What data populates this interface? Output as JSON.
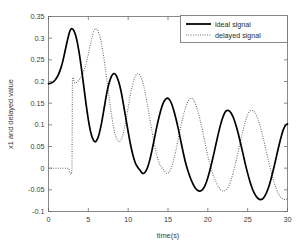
{
  "chart_data": {
    "type": "line",
    "title": "",
    "xlabel": "time(s)",
    "ylabel": "x1 and delayed value",
    "xlim": [
      0,
      30
    ],
    "ylim": [
      -0.1,
      0.35
    ],
    "xticks": [
      "0",
      "5",
      "10",
      "15",
      "20",
      "25",
      "30"
    ],
    "xtick_values": [
      0,
      5,
      10,
      15,
      20,
      25,
      30
    ],
    "yticks": [
      "0.35",
      "0.3",
      "0.25",
      "0.2",
      "0.15",
      "0.1",
      "0.05",
      "0",
      "-0.05",
      "-0.1"
    ],
    "ytick_values": [
      0.35,
      0.3,
      0.25,
      0.2,
      0.15,
      0.1,
      0.05,
      0,
      -0.05,
      -0.1
    ],
    "grid": false,
    "legend_position": "upper right",
    "legend": [
      "ideal signal",
      "delayed signal"
    ],
    "colors": {
      "ideal": "#000000",
      "delayed": "#555555",
      "axis": "#6b6b6b",
      "background": "#ffffff"
    },
    "series": [
      {
        "name": "ideal signal",
        "style": "solid",
        "x": [
          0.0,
          0.3,
          0.6,
          0.9,
          1.2,
          1.5,
          1.8,
          2.1,
          2.4,
          2.7,
          2.9,
          3.2,
          3.5,
          3.8,
          4.1,
          4.4,
          4.7,
          5.0,
          5.3,
          5.6,
          5.9,
          6.2,
          6.4,
          6.7,
          7.0,
          7.3,
          7.6,
          7.9,
          8.2,
          8.5,
          8.8,
          9.1,
          9.4,
          9.7,
          10.0,
          10.3,
          10.6,
          10.9,
          11.2,
          11.5,
          11.8,
          12.1,
          12.4,
          12.7,
          13.0,
          13.3,
          13.6,
          13.9,
          14.2,
          14.5,
          14.8,
          15.1,
          15.4,
          15.7,
          16.0,
          16.3,
          16.6,
          16.9,
          17.2,
          17.5,
          17.8,
          18.1,
          18.4,
          18.7,
          19.0,
          19.3,
          19.6,
          19.9,
          20.2,
          20.5,
          20.8,
          21.1,
          21.4,
          21.7,
          22.0,
          22.3,
          22.6,
          22.9,
          23.2,
          23.5,
          23.8,
          24.1,
          24.4,
          24.7,
          25.0,
          25.3,
          25.6,
          25.9,
          26.2,
          26.5,
          26.8,
          27.1,
          27.4,
          27.7,
          28.0,
          28.3,
          28.6,
          28.9,
          29.2,
          29.5,
          29.8,
          30.0
        ],
        "y": [
          0.195,
          0.196,
          0.199,
          0.205,
          0.214,
          0.228,
          0.247,
          0.272,
          0.297,
          0.317,
          0.322,
          0.317,
          0.3,
          0.272,
          0.235,
          0.193,
          0.15,
          0.112,
          0.083,
          0.066,
          0.061,
          0.07,
          0.082,
          0.108,
          0.14,
          0.172,
          0.196,
          0.212,
          0.218,
          0.214,
          0.2,
          0.178,
          0.148,
          0.116,
          0.084,
          0.054,
          0.03,
          0.012,
          0.002,
          -0.005,
          -0.012,
          -0.01,
          0.0,
          0.018,
          0.042,
          0.069,
          0.096,
          0.12,
          0.14,
          0.154,
          0.161,
          0.16,
          0.151,
          0.135,
          0.114,
          0.09,
          0.063,
          0.037,
          0.013,
          -0.006,
          -0.022,
          -0.035,
          -0.045,
          -0.051,
          -0.053,
          -0.05,
          -0.042,
          -0.028,
          -0.009,
          0.013,
          0.037,
          0.062,
          0.086,
          0.107,
          0.123,
          0.132,
          0.133,
          0.128,
          0.117,
          0.101,
          0.081,
          0.058,
          0.034,
          0.01,
          -0.012,
          -0.032,
          -0.048,
          -0.06,
          -0.068,
          -0.072,
          -0.072,
          -0.066,
          -0.055,
          -0.04,
          -0.02,
          0.002,
          0.026,
          0.05,
          0.072,
          0.09,
          0.1,
          0.102
        ]
      },
      {
        "name": "delayed signal",
        "style": "dotted",
        "delay_seconds": 3,
        "x": [
          0.0,
          0.5,
          1.0,
          1.5,
          2.0,
          2.5,
          2.95,
          3.0,
          3.3,
          3.6,
          3.9,
          4.2,
          4.5,
          4.8,
          5.1,
          5.4,
          5.7,
          5.9,
          6.2,
          6.5,
          6.8,
          7.1,
          7.4,
          7.7,
          8.0,
          8.3,
          8.6,
          8.9,
          9.2,
          9.4,
          9.7,
          10.0,
          10.3,
          10.6,
          10.9,
          11.2,
          11.5,
          11.8,
          12.1,
          12.4,
          12.7,
          13.0,
          13.3,
          13.6,
          13.9,
          14.2,
          14.5,
          14.8,
          15.1,
          15.4,
          15.7,
          16.0,
          16.3,
          16.6,
          16.9,
          17.2,
          17.5,
          17.8,
          18.1,
          18.4,
          18.7,
          19.0,
          19.3,
          19.6,
          19.9,
          20.2,
          20.5,
          20.8,
          21.1,
          21.4,
          21.7,
          22.0,
          22.3,
          22.6,
          22.9,
          23.2,
          23.5,
          23.8,
          24.1,
          24.4,
          24.7,
          25.0,
          25.3,
          25.6,
          25.9,
          26.2,
          26.5,
          26.8,
          27.1,
          27.4,
          27.7,
          28.0,
          28.3,
          28.6,
          28.9,
          29.2,
          29.5,
          29.8,
          30.0
        ],
        "y": [
          0.0,
          0.0,
          0.0,
          0.0,
          0.0,
          0.0,
          0.0,
          0.195,
          0.196,
          0.199,
          0.205,
          0.214,
          0.228,
          0.247,
          0.272,
          0.297,
          0.317,
          0.322,
          0.317,
          0.3,
          0.272,
          0.235,
          0.193,
          0.15,
          0.112,
          0.083,
          0.066,
          0.061,
          0.07,
          0.082,
          0.108,
          0.14,
          0.172,
          0.196,
          0.212,
          0.218,
          0.214,
          0.2,
          0.178,
          0.148,
          0.116,
          0.084,
          0.054,
          0.03,
          0.012,
          0.002,
          -0.005,
          -0.012,
          -0.01,
          0.0,
          0.018,
          0.042,
          0.069,
          0.096,
          0.12,
          0.14,
          0.154,
          0.161,
          0.16,
          0.151,
          0.135,
          0.114,
          0.09,
          0.063,
          0.037,
          0.013,
          -0.006,
          -0.022,
          -0.035,
          -0.045,
          -0.051,
          -0.053,
          -0.05,
          -0.042,
          -0.028,
          -0.009,
          0.013,
          0.037,
          0.062,
          0.086,
          0.107,
          0.123,
          0.132,
          0.133,
          0.128,
          0.117,
          0.101,
          0.081,
          0.058,
          0.034,
          0.01,
          -0.012,
          -0.032,
          -0.048,
          -0.06,
          -0.068,
          -0.072,
          -0.072,
          -0.071
        ]
      }
    ]
  }
}
